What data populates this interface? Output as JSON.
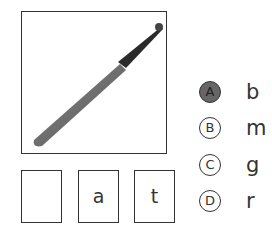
{
  "question": {
    "picture": {
      "subject": "baseball bat",
      "icon": "baseball-bat-icon"
    },
    "word_boxes": [
      "",
      "a",
      "t"
    ]
  },
  "options": [
    {
      "bubble": "A",
      "letter": "b",
      "selected": true
    },
    {
      "bubble": "B",
      "letter": "m",
      "selected": false
    },
    {
      "bubble": "C",
      "letter": "g",
      "selected": false
    },
    {
      "bubble": "D",
      "letter": "r",
      "selected": false
    }
  ],
  "colors": {
    "border": "#333333",
    "selected_fill": "#666666",
    "bat_barrel": "#6b6b6b",
    "bat_handle": "#2a2a2a"
  }
}
